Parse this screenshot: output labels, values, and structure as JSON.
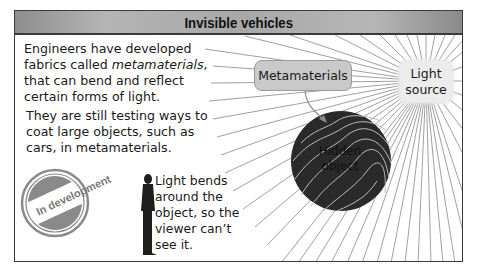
{
  "header": {
    "title": "Invisible vehicles"
  },
  "intro": {
    "line1": "Engineers have developed",
    "line2_prefix": "fabrics called ",
    "line2_emphasis": "metamaterials",
    "line2_suffix": ",",
    "line3": "that can bend and reflect",
    "line4": "certain forms of light."
  },
  "testing": {
    "line1": "They are still testing ways to",
    "line2": "coat large objects, such as",
    "line3": "cars, in metamaterials."
  },
  "stamp": {
    "label": "In development"
  },
  "viewer_note": {
    "line1": "Light bends",
    "line2": "around the",
    "line3": "object, so the",
    "line4": "viewer can’t",
    "line5": "see it."
  },
  "diagram": {
    "metamaterials_label": "Metamaterials",
    "light_source_line1": "Light",
    "light_source_line2": "source",
    "hidden_object_line1": "Hidden",
    "hidden_object_line2": "object"
  },
  "colors": {
    "frame_border": "#3a3a3a",
    "header_bg": "#a8a8a8",
    "hidden_object": "#2a2a2a",
    "rays": "#9a9a9a",
    "stamp": "#8a8a8a",
    "metamaterials_box": "#c9c9c9",
    "light_source_box": "#ececec"
  }
}
